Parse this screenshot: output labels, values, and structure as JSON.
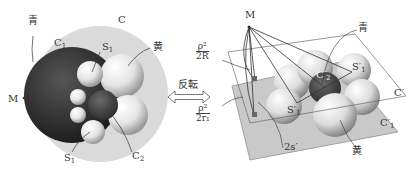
{
  "left_figure": {
    "outer_circle_label": "C",
    "large_dark_circle_label": "C",
    "large_dark_circle_sub": "1",
    "small_sphere_label": "S",
    "small_sphere_sub": "1",
    "bottom_sphere_label": "S",
    "bottom_sphere_sub": "1",
    "dark_small_circle_label": "C",
    "dark_small_circle_sub": "2",
    "point_label": "M",
    "blue_label": "青",
    "yellow_label": "黄"
  },
  "arrow": {
    "label": "反転",
    "type": "double-arrow"
  },
  "right_figure": {
    "point_label": "M",
    "top_fraction": {
      "numerator": "ρ²",
      "denominator": "2R"
    },
    "bottom_fraction": {
      "numerator": "ρ²",
      "denominator": "2r₁"
    },
    "distance_label": "2s′",
    "upper_plane_label": "C′",
    "lower_plane_label": "C′",
    "lower_plane_sub": "1",
    "sphere_center_label": "C′",
    "sphere_center_sub": "2",
    "left_sphere_label": "S′",
    "left_sphere_sub": "1",
    "right_sphere_label": "S′",
    "right_sphere_sub": "1",
    "blue_label": "青",
    "yellow_label": "黄"
  },
  "colors": {
    "outer_disc": "#d9d9d9",
    "dark_circle": "#222222",
    "light_sphere": "#f0f0f0",
    "plane_fill": "#c8c8c8",
    "line": "#333333"
  }
}
